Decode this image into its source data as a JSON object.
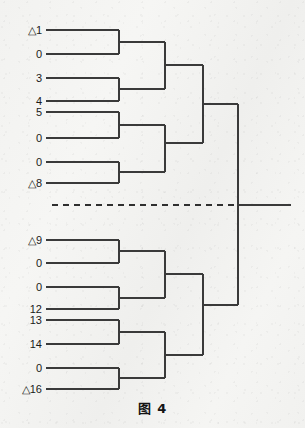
{
  "figure": {
    "caption": "图 4",
    "caption_prefix": "图",
    "caption_number": "4",
    "background_color": "#f2f2f0",
    "line_color": "#3a3a3a"
  },
  "chart_data": {
    "type": "dendrogram",
    "title": "图 4",
    "orientation": "horizontal-left-to-right",
    "grid": false,
    "legend": null,
    "xlabel": "",
    "ylabel": "",
    "note": "Binary hierarchical clustering tree (dendrogram). Leaves listed top to bottom; a horizontal dashed cut line separates the upper cluster group from the lower cluster group at the root split.",
    "leaves": [
      {
        "index": 0,
        "label": "△1",
        "text": "△1",
        "y": 30,
        "group": "upper"
      },
      {
        "index": 1,
        "label": "0",
        "text": "0",
        "y": 54,
        "group": "upper"
      },
      {
        "index": 2,
        "label": "3",
        "text": "3",
        "y": 78,
        "group": "upper"
      },
      {
        "index": 3,
        "label": "4",
        "text": "4",
        "y": 101,
        "group": "upper"
      },
      {
        "index": 4,
        "label": "5",
        "text": "5",
        "y": 112,
        "group": "upper"
      },
      {
        "index": 5,
        "label": "0",
        "text": "0",
        "y": 138,
        "group": "upper"
      },
      {
        "index": 6,
        "label": "0",
        "text": "0",
        "y": 162,
        "group": "upper"
      },
      {
        "index": 7,
        "label": "△8",
        "text": "△8",
        "y": 183,
        "group": "upper"
      },
      {
        "index": 8,
        "label": "△9",
        "text": "△9",
        "y": 240,
        "group": "lower"
      },
      {
        "index": 9,
        "label": "0",
        "text": "0",
        "y": 263,
        "group": "lower"
      },
      {
        "index": 10,
        "label": "0",
        "text": "0",
        "y": 287,
        "group": "lower"
      },
      {
        "index": 11,
        "label": "12",
        "text": "12",
        "y": 309,
        "group": "lower"
      },
      {
        "index": 12,
        "label": "13",
        "text": "13",
        "y": 320,
        "group": "lower"
      },
      {
        "index": 13,
        "label": "14",
        "text": "14",
        "y": 344,
        "group": "lower"
      },
      {
        "index": 14,
        "label": "0",
        "text": "0",
        "y": 368,
        "group": "lower"
      },
      {
        "index": 15,
        "label": "△16",
        "text": "△16",
        "y": 389,
        "group": "lower"
      }
    ],
    "merges": [
      {
        "id": "U1",
        "children": [
          "leaf0",
          "leaf1"
        ],
        "x": 119,
        "y_top": 30,
        "y_bottom": 54
      },
      {
        "id": "U2",
        "children": [
          "leaf2",
          "leaf3"
        ],
        "x": 119,
        "y_top": 78,
        "y_bottom": 101
      },
      {
        "id": "U3",
        "children": [
          "leaf4",
          "leaf5"
        ],
        "x": 119,
        "y_top": 112,
        "y_bottom": 138
      },
      {
        "id": "U4",
        "children": [
          "leaf6",
          "leaf7"
        ],
        "x": 119,
        "y_top": 162,
        "y_bottom": 183
      },
      {
        "id": "U12",
        "children": [
          "U1",
          "U2"
        ],
        "x": 165,
        "y_top": 42,
        "y_bottom": 89
      },
      {
        "id": "U34",
        "children": [
          "U3",
          "U4"
        ],
        "x": 165,
        "y_top": 125,
        "y_bottom": 172
      },
      {
        "id": "UTOP",
        "children": [
          "U12",
          "U34"
        ],
        "x": 203,
        "y_top": 65,
        "y_bottom": 143
      },
      {
        "id": "L1",
        "children": [
          "leaf8",
          "leaf9"
        ],
        "x": 119,
        "y_top": 240,
        "y_bottom": 263
      },
      {
        "id": "L2",
        "children": [
          "leaf10",
          "leaf11"
        ],
        "x": 119,
        "y_top": 287,
        "y_bottom": 309
      },
      {
        "id": "L3",
        "children": [
          "leaf12",
          "leaf13"
        ],
        "x": 119,
        "y_top": 320,
        "y_bottom": 344
      },
      {
        "id": "L4",
        "children": [
          "leaf14",
          "leaf15"
        ],
        "x": 119,
        "y_top": 368,
        "y_bottom": 389
      },
      {
        "id": "L12",
        "children": [
          "L1",
          "L2"
        ],
        "x": 165,
        "y_top": 251,
        "y_bottom": 298
      },
      {
        "id": "L34",
        "children": [
          "L3",
          "L4"
        ],
        "x": 165,
        "y_top": 332,
        "y_bottom": 378
      },
      {
        "id": "LTOP",
        "children": [
          "L12",
          "L34"
        ],
        "x": 203,
        "y_top": 274,
        "y_bottom": 355
      },
      {
        "id": "ROOT",
        "children": [
          "UTOP",
          "LTOP"
        ],
        "x": 238,
        "y_top": 104,
        "y_bottom": 305
      }
    ],
    "cut_line": {
      "style": "dashed",
      "y": 205,
      "x_start": 52,
      "x_end": 238,
      "label": ""
    },
    "root_stem": {
      "y": 205,
      "x_start": 238,
      "x_end": 291
    },
    "leaf_line_x_start": 46,
    "axis_ranges": {
      "x": [
        46,
        291
      ],
      "y": [
        30,
        389
      ]
    }
  }
}
